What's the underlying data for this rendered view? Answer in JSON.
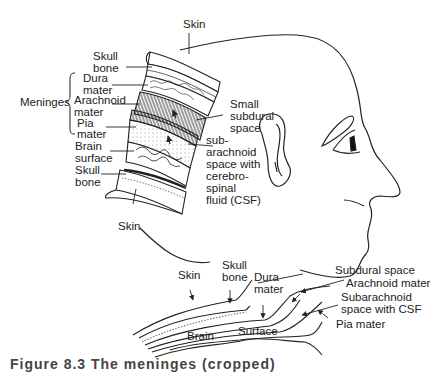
{
  "diagram": {
    "top_figure": {
      "labels": {
        "skin_top": "Skin",
        "skull_bone_top_1": "Skull",
        "skull_bone_top_2": "bone",
        "meninges": "Meninges",
        "dura_1": "Dura",
        "dura_2": "mater",
        "arachnoid_1": "Arachnoid",
        "arachnoid_2": "mater",
        "pia_1": "Pia",
        "pia_2": "mater",
        "brain_surface_1": "Brain",
        "brain_surface_2": "surface",
        "skull_bone_bottom_1": "Skull",
        "skull_bone_bottom_2": "bone",
        "skin_bottom": "Skin",
        "small_subdural_1": "Small",
        "small_subdural_2": "subdural",
        "small_subdural_3": "space",
        "subarachnoid_1": "sub-",
        "subarachnoid_2": "arachnoid",
        "subarachnoid_3": "space with",
        "subarachnoid_4": "cerebro-",
        "subarachnoid_5": "spinal",
        "subarachnoid_6": "fluid (CSF)"
      }
    },
    "bottom_figure": {
      "labels": {
        "skin": "Skin",
        "skull_bone_1": "Skull",
        "skull_bone_2": "bone",
        "dura_1": "Dura",
        "dura_2": "mater",
        "subdural_space": "Subdural space",
        "arachnoid_mater": "Arachnoid mater",
        "subarachnoid_1": "Subarachnoid",
        "subarachnoid_2": "space with CSF",
        "pia_mater": "Pia mater",
        "brain": "Brain",
        "surface": "Surface"
      }
    },
    "caption": "Figure 8.3  The meninges (cropped)"
  }
}
